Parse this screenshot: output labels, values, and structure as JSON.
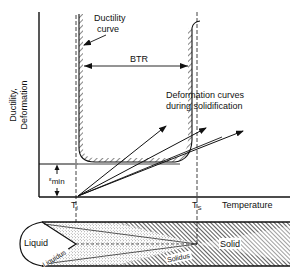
{
  "diagram": {
    "y_axis_label_line1": "Ductility,",
    "y_axis_label_line2": "Deformation",
    "x_axis_label": "Temperature",
    "ductility_curve_label_line1": "Ductility",
    "ductility_curve_label_line2": "curve",
    "btr_label": "BTR",
    "deformation_label_line1": "Deformation curves",
    "deformation_label_line2": "during  solidification",
    "emin_label": "ε",
    "emin_subscript": "min",
    "tl_label": "T",
    "tl_subscript": "l",
    "ts_label": "T",
    "ts_subscript": "S",
    "liquid_label": "Liquid",
    "liquidus_label": "Liquidus",
    "solidus_label": "Solidus",
    "solid_label": "Solid",
    "deformation_curve_count": 3
  },
  "colors": {
    "ink": "#111111",
    "background": "#ffffff",
    "stipple": "#555555"
  }
}
